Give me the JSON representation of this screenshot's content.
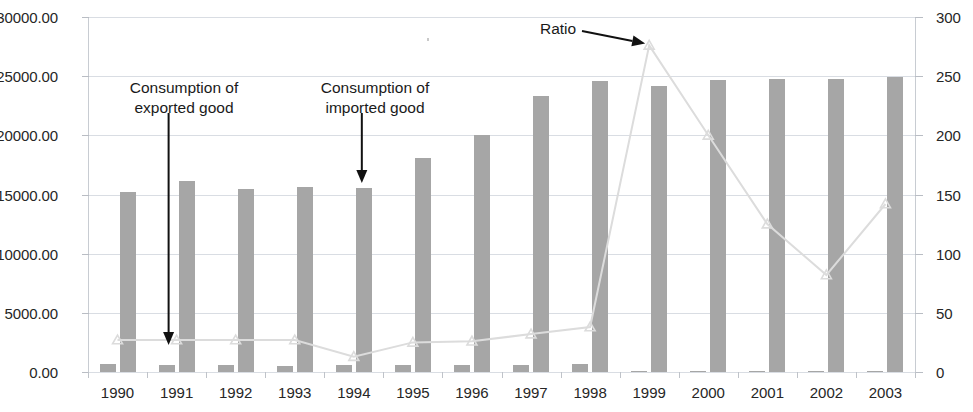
{
  "chart_data": {
    "type": "bar",
    "title": "",
    "subtitle": "",
    "xlabel": "",
    "ylabel": "",
    "categories": [
      "1990",
      "1991",
      "1992",
      "1993",
      "1994",
      "1995",
      "1996",
      "1997",
      "1998",
      "1999",
      "2000",
      "2001",
      "2002",
      "2003"
    ],
    "grid": true,
    "legend_position": "none",
    "axes": {
      "left": {
        "label": "",
        "ylim": [
          0,
          30000
        ],
        "ticks": [
          0,
          5000,
          10000,
          15000,
          20000,
          25000,
          30000
        ],
        "tick_labels": [
          "0.00",
          "5000.00",
          "10000.00",
          "15000.00",
          "20000.00",
          "25000.00",
          "30000.00"
        ]
      },
      "right": {
        "label": "",
        "ylim": [
          0,
          300
        ],
        "ticks": [
          0,
          50,
          100,
          150,
          200,
          250,
          300
        ],
        "tick_labels": [
          "0",
          "50",
          "100",
          "150",
          "200",
          "250",
          "300"
        ]
      }
    },
    "series": [
      {
        "name": "Consumption of exported good",
        "type": "bar",
        "axis": "left",
        "color": "#a6a6a6",
        "values": [
          640,
          630,
          560,
          540,
          600,
          570,
          620,
          600,
          640,
          120,
          70,
          60,
          60,
          60
        ]
      },
      {
        "name": "Consumption of imported good",
        "type": "bar",
        "axis": "left",
        "color": "#a6a6a6",
        "values": [
          15250,
          16100,
          15450,
          15600,
          15550,
          18100,
          20050,
          23350,
          24600,
          24150,
          24650,
          24800,
          24800,
          24900
        ]
      },
      {
        "name": "Ratio",
        "type": "line",
        "axis": "right",
        "color": "#dcdcdc",
        "marker": "triangle",
        "values": [
          27,
          27,
          27,
          27,
          13,
          25,
          26,
          32,
          38,
          276,
          200,
          125,
          82,
          142
        ]
      }
    ],
    "annotations": [
      {
        "id": "exported",
        "lines": [
          "Consumption of",
          "exported good"
        ],
        "points_to_category": "1991",
        "points_to_series": "Consumption of exported good"
      },
      {
        "id": "imported",
        "lines": [
          "Consumption of",
          "imported good"
        ],
        "points_to_category": "1994",
        "points_to_series": "Consumption of imported good"
      },
      {
        "id": "ratio",
        "lines": [
          "Ratio"
        ],
        "points_to_category": "1999",
        "points_to_series": "Ratio"
      }
    ]
  }
}
